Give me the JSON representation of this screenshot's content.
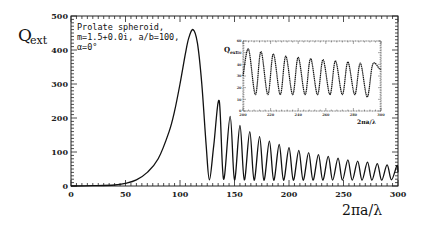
{
  "chart_data": [
    {
      "id": "main",
      "type": "line",
      "title": "",
      "xlabel": "2πa/λ",
      "ylabel": "Q",
      "ylabel_sub": "ext",
      "xlim": [
        0,
        300
      ],
      "ylim": [
        0,
        500
      ],
      "grid": false,
      "x_ticks": [
        0,
        50,
        100,
        150,
        200,
        250,
        300
      ],
      "y_ticks": [
        0,
        100,
        200,
        300,
        400,
        500
      ],
      "annotation": [
        "Prolate spheroid,",
        "m=1.5+0.0i,  a/b=100,",
        "α=0°"
      ],
      "series": [
        {
          "name": "Q_ext",
          "x": [
            0,
            20,
            40,
            50,
            60,
            70,
            80,
            90,
            95,
            100,
            105,
            108,
            112,
            116,
            120,
            124,
            127,
            131,
            136,
            140,
            146,
            150,
            155,
            159,
            164,
            168,
            173,
            177,
            182,
            186,
            191,
            195,
            200,
            204,
            209,
            213,
            218,
            222,
            227,
            231,
            236,
            240,
            245,
            249,
            254,
            258,
            263,
            267,
            272,
            276,
            281,
            285,
            290,
            294,
            299,
            300
          ],
          "y": [
            0,
            1,
            3,
            8,
            18,
            40,
            80,
            160,
            220,
            300,
            390,
            435,
            460,
            420,
            300,
            120,
            18,
            120,
            250,
            20,
            205,
            18,
            178,
            18,
            160,
            17,
            145,
            17,
            132,
            17,
            122,
            17,
            113,
            17,
            105,
            17,
            98,
            17,
            92,
            17,
            87,
            17,
            82,
            17,
            77,
            17,
            73,
            17,
            70,
            17,
            66,
            17,
            62,
            18,
            60,
            40
          ]
        }
      ]
    },
    {
      "id": "inset",
      "type": "line",
      "title": "",
      "xlabel": "2πa/λ",
      "ylabel": "Q",
      "ylabel_sub": "ext",
      "xlim": [
        200,
        300
      ],
      "ylim": [
        0,
        60
      ],
      "grid": false,
      "x_ticks": [
        200,
        220,
        240,
        260,
        280,
        300
      ],
      "y_ticks": [
        0,
        10,
        20,
        30,
        40,
        50,
        60
      ],
      "series": [
        {
          "name": "Q_ext (inset)",
          "x": [
            200,
            204,
            209,
            213,
            218,
            222,
            227,
            231,
            236,
            240,
            245,
            249,
            254,
            258,
            263,
            267,
            272,
            276,
            281,
            285,
            290,
            294,
            299,
            300
          ],
          "y": [
            30,
            53,
            14,
            51,
            14,
            49,
            14,
            47,
            14,
            46,
            14,
            45,
            14,
            44,
            14,
            43,
            14,
            42,
            14,
            41,
            12,
            40,
            36,
            36
          ]
        }
      ]
    }
  ],
  "labels": {
    "ylabel": "Q",
    "ylabel_sub": "ext",
    "xlabel": "2πa/λ",
    "annotation_line1": "Prolate spheroid,",
    "annotation_line2": "m=1.5+0.0i,  a/b=100,",
    "annotation_line3": "α=0°",
    "inset_ylabel": "Q",
    "inset_ylabel_sub": "ext",
    "inset_xlabel": "2πa/λ"
  }
}
